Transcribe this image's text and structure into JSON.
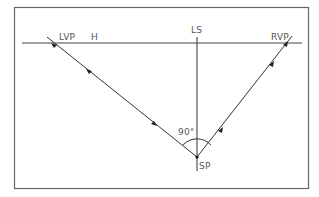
{
  "diagram": {
    "labels": {
      "lvp": "LVP",
      "horizon": "H",
      "line_of_sight": "LS",
      "rvp": "RVP",
      "angle": "90°",
      "station_point": "SP"
    },
    "colors": {
      "line": "#333333",
      "frame": "#666666",
      "text": "#555555",
      "background": "#ffffff"
    }
  }
}
